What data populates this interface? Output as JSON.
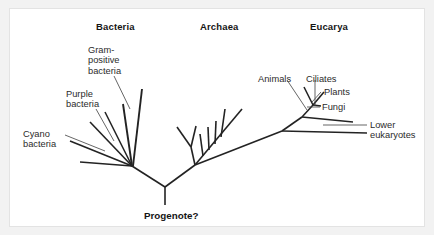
{
  "figure": {
    "type": "phylogenetic-tree",
    "background_color": "#f2f2f2",
    "panel_color": "#ffffff",
    "line_color": "#232323",
    "text_color": "#2b2b2b"
  },
  "domains": [
    {
      "name": "bacteria",
      "label": "Bacteria",
      "x": 86,
      "y": 12
    },
    {
      "name": "archaea",
      "label": "Archaea",
      "x": 190,
      "y": 12
    },
    {
      "name": "eucarya",
      "label": "Eucarya",
      "x": 300,
      "y": 12
    }
  ],
  "taxa": [
    {
      "name": "gram-positive-bacteria",
      "lines": [
        "Gram-",
        "positive",
        "bacteria"
      ],
      "x": 78,
      "y": 36,
      "align": "left"
    },
    {
      "name": "purple-bacteria",
      "lines": [
        "Purple",
        "bacteria"
      ],
      "x": 56,
      "y": 80,
      "align": "left"
    },
    {
      "name": "cyano-bacteria",
      "lines": [
        "Cyano",
        "bacteria"
      ],
      "x": 13,
      "y": 120,
      "align": "left"
    },
    {
      "name": "animals",
      "lines": [
        "Animals"
      ],
      "x": 248,
      "y": 65,
      "align": "left"
    },
    {
      "name": "ciliates",
      "lines": [
        "Ciliates"
      ],
      "x": 296,
      "y": 65,
      "align": "left"
    },
    {
      "name": "plants",
      "lines": [
        "Plants"
      ],
      "x": 314,
      "y": 80,
      "align": "left"
    },
    {
      "name": "fungi",
      "lines": [
        "Fungi"
      ],
      "x": 312,
      "y": 95,
      "align": "left"
    },
    {
      "name": "lower-eukaryotes",
      "lines": [
        "Lower",
        "eukaryotes"
      ],
      "x": 360,
      "y": 110,
      "align": "left"
    }
  ],
  "root": {
    "name": "progenote",
    "label": "Progenote?",
    "x": 134,
    "y": 201
  },
  "tree_structure": {
    "root_node": {
      "x": 155,
      "y": 178
    },
    "root_stem_end": {
      "x": 155,
      "y": 196
    },
    "bacteria_node": {
      "x": 122,
      "y": 157
    },
    "archaea_node": {
      "x": 185,
      "y": 155
    },
    "eucarya_node": {
      "x": 272,
      "y": 122
    },
    "bacteria_tips": 6,
    "archaea_tips": 7,
    "eucarya_tips": 5
  }
}
